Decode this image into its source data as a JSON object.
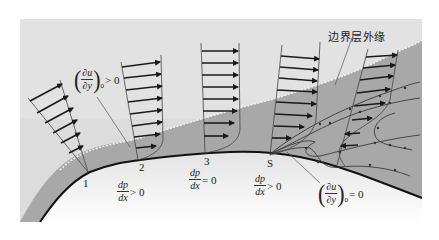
{
  "figure": {
    "colors": {
      "outer_flow_bg": "#dcdcdc",
      "boundary_layer_fill": "#a9a9a9",
      "wall_line": "#111111",
      "arrow": "#1a1a1a",
      "body_bg_top": "#e6e6e6",
      "body_bg_bottom": "#ffffff"
    },
    "labels": {
      "boundary_layer_edge": "边界层外缘",
      "station_1": "1",
      "station_2": "2",
      "station_3": "3",
      "station_s": "S"
    },
    "annotations": {
      "wall_gradient_positive": {
        "num": "∂u",
        "den": "∂y",
        "sub": "0",
        "relation": "> 0"
      },
      "wall_gradient_zero": {
        "num": "∂u",
        "den": "∂y",
        "sub": "0",
        "relation": "= 0"
      },
      "pressure_gradient_1": {
        "num": "dp",
        "den": "dx",
        "relation": "> 0"
      },
      "pressure_gradient_3": {
        "num": "dp",
        "den": "dx",
        "relation": "= 0"
      },
      "pressure_gradient_s": {
        "num": "dp",
        "den": "dx",
        "relation": "> 0"
      }
    },
    "velocity_profiles": [
      {
        "station": "1",
        "arrows": 6
      },
      {
        "station": "2",
        "arrows": 8
      },
      {
        "station": "3",
        "arrows": 8
      },
      {
        "station": "S",
        "arrows": 8
      },
      {
        "station": "downstream",
        "arrows": 8,
        "reversed_near_wall": 2
      }
    ]
  }
}
